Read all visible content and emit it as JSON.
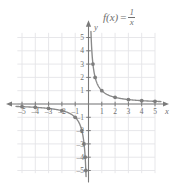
{
  "figure": {
    "kind": "cartesian-graph",
    "width": 174,
    "height": 190,
    "background": "#ffffff"
  },
  "function_label": {
    "prefix": "f(x)",
    "equals": "=",
    "numerator": "1",
    "denominator": "x",
    "plain": "f(x) = 1/x"
  },
  "axes": {
    "x_axis_label": "x",
    "y_axis_label": "y",
    "x_ticks": [
      "-5",
      "-4",
      "-3",
      "-2",
      "-1",
      "1",
      "2",
      "3",
      "4",
      "5"
    ],
    "y_ticks": [
      "5",
      "4",
      "3",
      "2",
      "1",
      "-1",
      "-2",
      "-3",
      "-4",
      "-5"
    ],
    "xlim": [
      -5.6,
      5.6
    ],
    "ylim": [
      -5.6,
      5.6
    ],
    "grid": true,
    "origin_label": ""
  },
  "colors": {
    "curve": "#8a8a8a",
    "point": "#7e7e7e",
    "axis": "#7a7a7a",
    "grid": "#e4e4e8",
    "tick_text": "#6f6f6f",
    "label_text": "#6f6f6f"
  },
  "chart_data": {
    "type": "line",
    "title": "",
    "subtitle": "",
    "xlabel": "x",
    "ylabel": "y",
    "xlim": [
      -5.6,
      5.6
    ],
    "ylim": [
      -5.6,
      5.6
    ],
    "grid": true,
    "legend_position": "none",
    "annotations": [
      "f(x) = 1/x"
    ],
    "xticks": [
      -5,
      -4,
      -3,
      -2,
      -1,
      1,
      2,
      3,
      4,
      5
    ],
    "yticks": [
      5,
      4,
      3,
      2,
      1,
      -1,
      -2,
      -3,
      -4,
      -5
    ],
    "series": [
      {
        "name": "f(x) = 1/x (branch x > 0)",
        "x": [
          0.2,
          0.25,
          0.3333,
          0.5,
          1,
          2,
          3,
          4,
          5
        ],
        "y": [
          5,
          4,
          3,
          2,
          1,
          0.5,
          0.3333,
          0.25,
          0.2
        ],
        "marked_points": [
          {
            "x": 0.3333,
            "y": 3
          },
          {
            "x": 0.5,
            "y": 2
          },
          {
            "x": 1,
            "y": 1
          },
          {
            "x": 2,
            "y": 0.5
          },
          {
            "x": 3,
            "y": 0.3333
          },
          {
            "x": 4,
            "y": 0.25
          },
          {
            "x": 5,
            "y": 0.2
          }
        ]
      },
      {
        "name": "f(x) = 1/x (branch x < 0)",
        "x": [
          -5,
          -4,
          -3,
          -2,
          -1,
          -0.5,
          -0.3333,
          -0.25,
          -0.2
        ],
        "y": [
          -0.2,
          -0.25,
          -0.3333,
          -0.5,
          -1,
          -2,
          -3,
          -4,
          -5
        ],
        "marked_points": [
          {
            "x": -5,
            "y": -0.2
          },
          {
            "x": -4,
            "y": -0.25
          },
          {
            "x": -3,
            "y": -0.3333
          },
          {
            "x": -2,
            "y": -0.5
          },
          {
            "x": -1,
            "y": -1
          },
          {
            "x": -0.5,
            "y": -2
          },
          {
            "x": -0.3333,
            "y": -3
          },
          {
            "x": -0.25,
            "y": -4
          },
          {
            "x": -0.2,
            "y": -5
          }
        ]
      }
    ]
  }
}
